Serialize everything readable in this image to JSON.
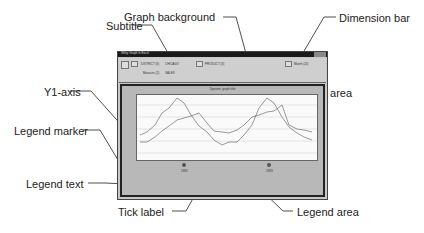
{
  "diagram": {
    "callouts": {
      "graph_background": "Graph background",
      "subtitle": "Subtitle",
      "dimension_bar": "Dimension bar",
      "plot_area": "Plot area",
      "y1_axis": "Y1-axis",
      "legend_marker": "Legend marker",
      "legend_text": "Legend text",
      "x_axis": "X-axis",
      "tick_label": "Tick label",
      "legend_area": "Legend area"
    },
    "window": {
      "title": "Wiley Graph in Excel",
      "dimensions": {
        "district": "DISTRICT (6)",
        "district_value": "CHICAGO",
        "measure": "Measure (2)",
        "measure_value": "SALES",
        "product": "PRODUCT (3)",
        "month": "Month (24)"
      },
      "subtitle": "Dynamic graph title",
      "legend": [
        "1992",
        "1993"
      ]
    }
  }
}
